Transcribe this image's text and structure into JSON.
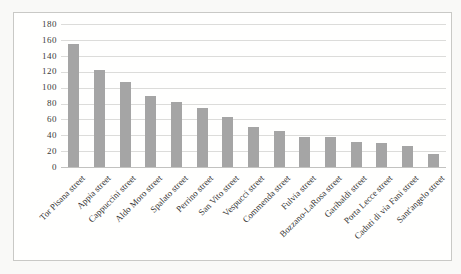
{
  "figure": {
    "page_background": "#f9f9f7",
    "frame_border_color": "#c9c9c6",
    "plot_background": "#fffffe"
  },
  "chart_data": {
    "type": "bar",
    "title": "",
    "xlabel": "",
    "ylabel": "",
    "categories": [
      "Tor Pisana street",
      "Appia street",
      "Cappuccini street",
      "Aldo Moro street",
      "Spalato street",
      "Perrino street",
      "San Vito street",
      "Vespucci street",
      "Commenda street",
      "Fulvia street",
      "Bozzano-LaRosa street",
      "Garibaldi street",
      "Porta Lecce street",
      "Caduti di via Fani street",
      "Sant'angelo street"
    ],
    "values": [
      155,
      122,
      107,
      89,
      82,
      75,
      63,
      50,
      45,
      38,
      38,
      32,
      30,
      26,
      16
    ],
    "ylim": [
      0,
      180
    ],
    "yticks": [
      0,
      20,
      40,
      60,
      80,
      100,
      120,
      140,
      160,
      180
    ],
    "grid": true,
    "legend": false,
    "x_label_rotation_deg": -45,
    "bar_color": "#a5a5a5",
    "gridline_color": "#dcdcda",
    "axis_line_color": "#c2c2c0",
    "tick_label_color": "#3b3b3b"
  }
}
